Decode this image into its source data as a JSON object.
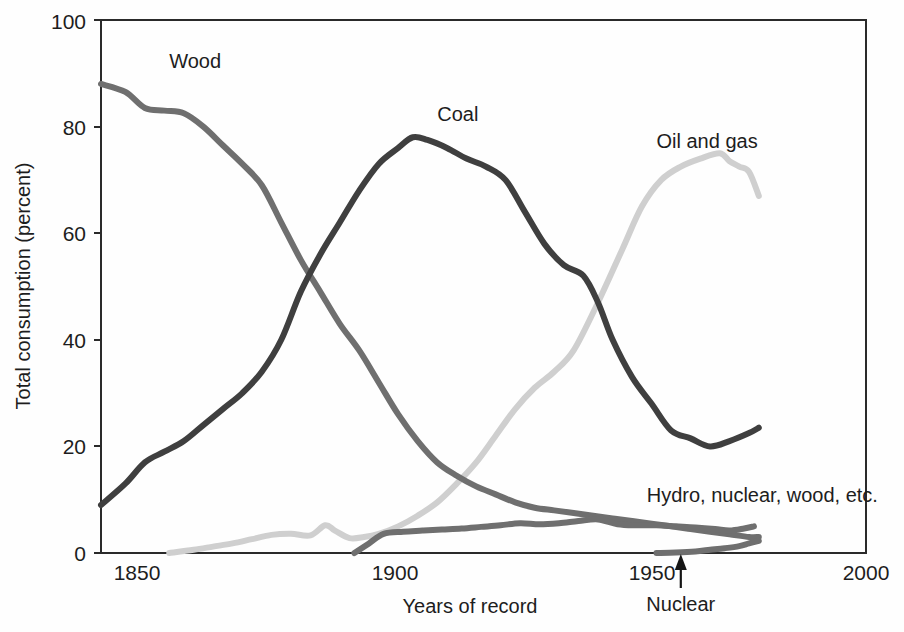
{
  "chart_data": {
    "type": "line",
    "title": "",
    "xlabel": "Years of record",
    "ylabel": "Total consumption (percent)",
    "xlim": [
      1843,
      2000
    ],
    "ylim": [
      0,
      100
    ],
    "grid": false,
    "legend_position": "inline-labels",
    "x_ticks": [
      "1850",
      "1900",
      "1950",
      "2000"
    ],
    "x_tick_values": [
      1850,
      1900,
      1950,
      2000
    ],
    "y_ticks": [
      "0",
      "20",
      "40",
      "60",
      "80",
      "100"
    ],
    "y_tick_values": [
      0,
      20,
      40,
      60,
      80,
      100
    ],
    "colors": {
      "wood": "#6f6f6f",
      "coal": "#3f3f3f",
      "oil_and_gas": "#cfcfcf",
      "hydro_nuclear_wood": "#6f6f6f",
      "nuclear": "#6f6f6f",
      "axis": "#2a2a2a",
      "text": "#1d1d1d"
    },
    "series": [
      {
        "name": "Wood",
        "label": "Wood",
        "color": "#6f6f6f",
        "label_x": 1857,
        "label_y": 91,
        "x": [
          1843,
          1848,
          1852,
          1856,
          1860,
          1864,
          1868,
          1872,
          1876,
          1880,
          1884,
          1888,
          1892,
          1896,
          1900,
          1904,
          1908,
          1912,
          1916,
          1920,
          1924,
          1928,
          1932,
          1936,
          1940,
          1944,
          1948,
          1952,
          1956,
          1960,
          1964,
          1968,
          1972,
          1976,
          1978
        ],
        "values": [
          88,
          86.5,
          83.5,
          83,
          82.5,
          80,
          76.5,
          73,
          69,
          62,
          55,
          49,
          43,
          38,
          32,
          26,
          21,
          17,
          14.5,
          12.5,
          11,
          9.5,
          8.5,
          8,
          7.5,
          7,
          6.5,
          6,
          5.5,
          5,
          4.5,
          4,
          3.5,
          3,
          3
        ]
      },
      {
        "name": "Coal",
        "label": "Coal",
        "color": "#3f3f3f",
        "label_x": 1912,
        "label_y": 81,
        "x": [
          1843,
          1848,
          1852,
          1856,
          1860,
          1864,
          1868,
          1872,
          1876,
          1880,
          1884,
          1888,
          1892,
          1896,
          1900,
          1904,
          1907,
          1910,
          1914,
          1918,
          1922,
          1926,
          1930,
          1934,
          1938,
          1942,
          1945,
          1948,
          1952,
          1956,
          1960,
          1964,
          1968,
          1972,
          1976,
          1978
        ],
        "values": [
          9,
          13,
          17,
          19,
          21,
          24,
          27,
          30,
          34,
          40,
          49,
          56,
          62,
          68,
          73,
          76,
          78,
          77.5,
          76,
          74,
          72.5,
          70,
          64,
          58,
          54,
          52,
          47,
          40,
          33,
          28,
          23,
          21.5,
          20,
          21,
          22.5,
          23.5
        ]
      },
      {
        "name": "Oil and gas",
        "label": "Oil and gas",
        "color": "#cfcfcf",
        "label_x": 1957,
        "label_y": 76,
        "x": [
          1857,
          1862,
          1866,
          1870,
          1874,
          1878,
          1882,
          1886,
          1889,
          1891,
          1894,
          1897,
          1900,
          1904,
          1908,
          1912,
          1916,
          1920,
          1924,
          1928,
          1932,
          1936,
          1940,
          1945,
          1950,
          1954,
          1958,
          1962,
          1966,
          1970,
          1972,
          1974,
          1976,
          1978
        ],
        "values": [
          0,
          0.6,
          1.2,
          1.8,
          2.6,
          3.4,
          3.6,
          3.3,
          5.2,
          4.2,
          2.8,
          3.0,
          3.6,
          5.0,
          7.0,
          9.5,
          13,
          17,
          22,
          27,
          31,
          34,
          38,
          47,
          57,
          65,
          70,
          72.5,
          74,
          75,
          73.5,
          72.5,
          71.5,
          67
        ]
      },
      {
        "name": "Hydro, nuclear, wood, etc.",
        "label": "Hydro, nuclear, wood, etc.",
        "color": "#6f6f6f",
        "label_x": 1955,
        "label_y": 9.5,
        "x": [
          1895,
          1898,
          1901,
          1905,
          1909,
          1913,
          1917,
          1921,
          1925,
          1929,
          1933,
          1937,
          1941,
          1945,
          1949,
          1953,
          1957,
          1961,
          1965,
          1969,
          1972,
          1975,
          1977
        ],
        "values": [
          0,
          1.8,
          3.6,
          4.0,
          4.2,
          4.4,
          4.6,
          4.9,
          5.2,
          5.6,
          5.4,
          5.6,
          6.0,
          6.3,
          5.4,
          5.2,
          5.2,
          5.0,
          4.8,
          4.5,
          4.2,
          4.6,
          5.0
        ]
      },
      {
        "name": "Nuclear",
        "label": "Nuclear",
        "color": "#6f6f6f",
        "label_x": 1962,
        "label_y": -7,
        "x": [
          1957,
          1961,
          1965,
          1968,
          1971,
          1974,
          1976,
          1978
        ],
        "values": [
          0,
          0.1,
          0.3,
          0.6,
          0.9,
          1.3,
          1.8,
          2.3
        ]
      }
    ],
    "annotations": [
      {
        "name": "nuclear-arrow",
        "text": "Nuclear",
        "x": 1962,
        "points_to_y": 0
      }
    ]
  },
  "labels": {
    "wood": "Wood",
    "coal": "Coal",
    "oil_and_gas": "Oil and gas",
    "hydro": "Hydro, nuclear, wood, etc.",
    "nuclear": "Nuclear",
    "xlabel": "Years of record",
    "ylabel": "Total consumption (percent)"
  },
  "y_tick_labels": {
    "t0": "0",
    "t20": "20",
    "t40": "40",
    "t60": "60",
    "t80": "80",
    "t100": "100"
  },
  "x_tick_labels": {
    "t1850": "1850",
    "t1900": "1900",
    "t1950": "1950",
    "t2000": "2000"
  }
}
